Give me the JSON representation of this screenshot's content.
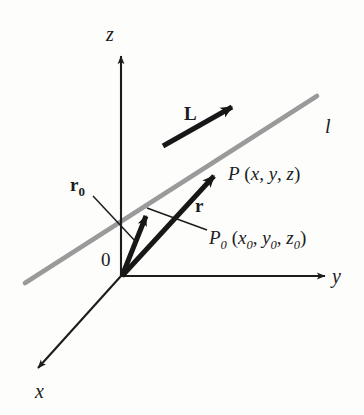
{
  "figure": {
    "background_color": "#fdfdfc",
    "stroke_color": "#1c1c1c",
    "line_color": "#9a9a9a"
  },
  "axes": [
    {
      "name": "z-axis",
      "label": "z"
    },
    {
      "name": "y-axis",
      "label": "y"
    },
    {
      "name": "x-axis",
      "label": "x"
    }
  ],
  "origin": {
    "label": "0"
  },
  "vectors": [
    {
      "name": "direction-vector",
      "label": "L"
    },
    {
      "name": "position-vector-r",
      "label": "r"
    },
    {
      "name": "position-vector-r0",
      "label_base": "r",
      "label_sub": "0"
    }
  ],
  "points": [
    {
      "name": "point-P",
      "base": "P",
      "sub": "",
      "coords_open": " (",
      "c1": "x",
      "c1sub": "",
      "sep1": ", ",
      "c2": "y",
      "c2sub": "",
      "sep2": ", ",
      "c3": "z",
      "c3sub": "",
      "coords_close": ")"
    },
    {
      "name": "point-P0",
      "base": "P",
      "sub": "0",
      "coords_open": " (",
      "c1": "x",
      "c1sub": "0",
      "sep1": ", ",
      "c2": "y",
      "c2sub": "0",
      "sep2": ", ",
      "c3": "z",
      "c3sub": "0",
      "coords_close": ")"
    }
  ],
  "line": {
    "name": "line-l",
    "label": "l"
  }
}
